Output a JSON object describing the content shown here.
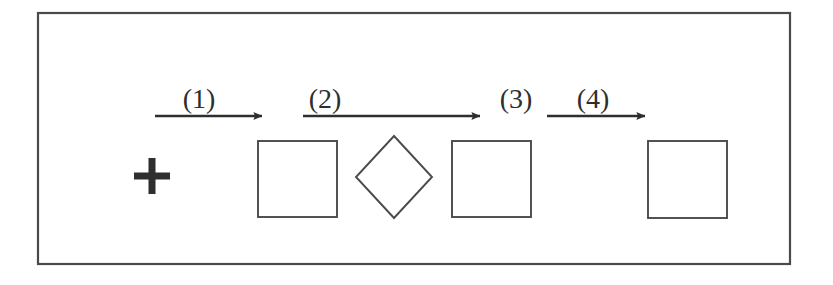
{
  "figure": {
    "background_color": "#ffffff",
    "ink_color": "#3a3a3a",
    "border": {
      "name": "figure-frame",
      "x": 38,
      "y": 13,
      "width": 752,
      "height": 251,
      "stroke_width": 2.2,
      "color": "#4a4a4a"
    },
    "step_labels": [
      {
        "text": "(1)",
        "cx": 199,
        "baseline_y": 108
      },
      {
        "text": "(2)",
        "cx": 325,
        "baseline_y": 108
      },
      {
        "text": "(3)",
        "cx": 516,
        "baseline_y": 108
      },
      {
        "text": "(4)",
        "cx": 593,
        "baseline_y": 108
      }
    ],
    "arrows": [
      {
        "name": "arrow-1",
        "x1": 155,
        "x2": 262,
        "y": 116
      },
      {
        "name": "arrow-2",
        "x1": 303,
        "x2": 480,
        "y": 116
      },
      {
        "name": "arrow-3",
        "x1": 547,
        "x2": 645,
        "y": 116
      }
    ],
    "stimuli": [
      {
        "name": "fixation-cross",
        "shape": "plus",
        "cx": 152,
        "cy": 176,
        "arm": 18,
        "thickness": 7
      },
      {
        "name": "square-1",
        "shape": "square",
        "x": 258,
        "y": 141,
        "width": 79,
        "height": 76
      },
      {
        "name": "diamond",
        "shape": "diamond",
        "cx": 394,
        "cy": 177,
        "half_width": 38,
        "half_height": 41
      },
      {
        "name": "square-2",
        "shape": "square",
        "x": 452,
        "y": 141,
        "width": 79,
        "height": 76
      },
      {
        "name": "square-3",
        "shape": "square",
        "x": 648,
        "y": 141,
        "width": 79,
        "height": 77
      }
    ]
  }
}
